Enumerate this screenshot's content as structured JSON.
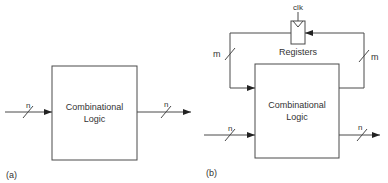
{
  "diagram_a": {
    "caption": "(a)",
    "block_line1": "Combinational",
    "block_line2": "Logic",
    "input_width": "n",
    "output_width": "n"
  },
  "diagram_b": {
    "caption": "(b)",
    "block_line1": "Combinational",
    "block_line2": "Logic",
    "input_width": "n",
    "output_width": "n",
    "register_label": "Registers",
    "clock_label": "clk",
    "feedback_left_width": "m",
    "feedback_right_width": "m"
  },
  "colors": {
    "line": "#4a4a4a",
    "text": "#333333"
  }
}
